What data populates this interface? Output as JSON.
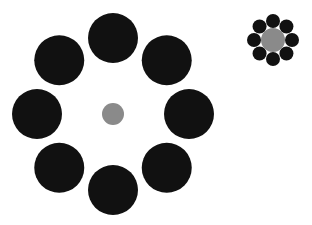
{
  "figure": {
    "width": 312,
    "height": 225,
    "colors": {
      "background": "#ffffff",
      "surround": "#111111",
      "target": "#8a8a8a"
    },
    "groups": [
      {
        "name": "large-surround",
        "cx": 113,
        "cy": 114,
        "center_r": 11,
        "orbit_r": 76,
        "surround_r": 25,
        "count": 8
      },
      {
        "name": "small-surround",
        "cx": 273,
        "cy": 40,
        "center_r": 12,
        "orbit_r": 19,
        "surround_r": 7,
        "count": 8
      }
    ]
  }
}
